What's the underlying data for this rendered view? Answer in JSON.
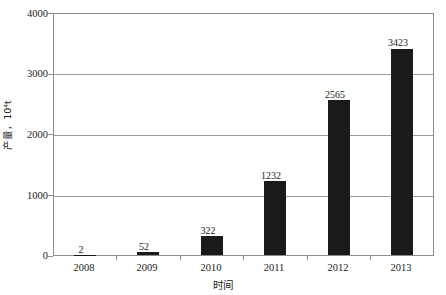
{
  "chart_data": {
    "type": "bar",
    "title": "",
    "xlabel": "时间",
    "ylabel": "产量，10⁴t",
    "categories": [
      "2008",
      "2009",
      "2010",
      "2011",
      "2012",
      "2013"
    ],
    "values": [
      2,
      52,
      322,
      1232,
      2565,
      3423
    ],
    "value_labels": [
      "2",
      "52",
      "322",
      "1232",
      "2565",
      "3423"
    ],
    "series": [
      {
        "name": "产量",
        "values": [
          2,
          52,
          322,
          1232,
          2565,
          3423
        ],
        "color": "#1a1a1a"
      }
    ],
    "ylim": [
      0,
      4000
    ],
    "y_ticks": [
      0,
      1000,
      2000,
      3000,
      4000
    ],
    "y_tick_labels": [
      "0",
      "1000",
      "2000",
      "3000",
      "4000"
    ],
    "grid": true,
    "grid_axis": "y",
    "legend": false,
    "legend_position": "none",
    "bar_color": "#1a1a1a",
    "gridline_color": "#9a9a9a",
    "frame_color": "#8c8c8c",
    "background": "#ffffff"
  },
  "axes": {
    "y_title": "产量，10⁴t",
    "x_title": "时间"
  }
}
